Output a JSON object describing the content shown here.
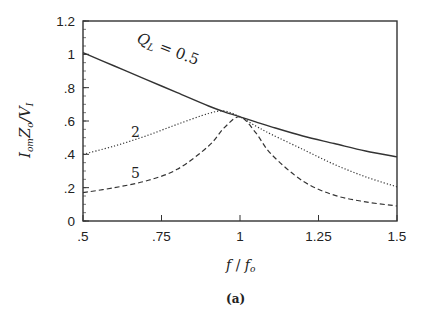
{
  "chart_data": {
    "type": "line",
    "title": "",
    "caption": "(a)",
    "xlabel": "f / f_o",
    "ylabel": "I_om Z_o / V_I",
    "xlim": [
      0.5,
      1.5
    ],
    "ylim": [
      0,
      1.2
    ],
    "grid": false,
    "legend": "inline labels",
    "x_ticks": [
      0.5,
      0.75,
      1.0,
      1.25,
      1.5
    ],
    "x_tick_labels": [
      ".5",
      ".75",
      "1",
      "1.25",
      "1.5"
    ],
    "y_ticks": [
      0,
      0.2,
      0.4,
      0.6,
      0.8,
      1.0,
      1.2
    ],
    "y_tick_labels": [
      "0",
      ".2",
      ".4",
      ".6",
      ".8",
      "1",
      "1.2"
    ],
    "x": [
      0.5,
      0.6,
      0.7,
      0.8,
      0.9,
      0.95,
      1.0,
      1.05,
      1.1,
      1.2,
      1.3,
      1.4,
      1.5
    ],
    "series": [
      {
        "name": "Q_L = 0.5",
        "style": "solid",
        "label_text": "Q_L = 0.5",
        "values": [
          1.01,
          0.93,
          0.85,
          0.77,
          0.69,
          0.655,
          0.625,
          0.595,
          0.565,
          0.51,
          0.465,
          0.42,
          0.385
        ]
      },
      {
        "name": "Q_L = 2",
        "style": "dotted",
        "label_text": "2",
        "values": [
          0.4,
          0.45,
          0.51,
          0.58,
          0.645,
          0.66,
          0.625,
          0.57,
          0.52,
          0.43,
          0.34,
          0.265,
          0.205
        ]
      },
      {
        "name": "Q_L = 5",
        "style": "dashed",
        "label_text": "5",
        "values": [
          0.17,
          0.2,
          0.24,
          0.31,
          0.45,
          0.56,
          0.625,
          0.53,
          0.4,
          0.24,
          0.155,
          0.115,
          0.09
        ]
      }
    ]
  },
  "axes": {
    "x_label_main": "f",
    "x_label_sep": " / ",
    "x_label_sub_base": "f",
    "x_label_sub": "o",
    "y_label_parts": [
      "I",
      "om",
      "Z",
      "o",
      "/V",
      "I"
    ]
  },
  "labels": {
    "ql_q": "Q",
    "ql_sub": "L",
    "ql_rest": " = 0.5",
    "q2": "2",
    "q5": "5",
    "caption": "(a)"
  }
}
